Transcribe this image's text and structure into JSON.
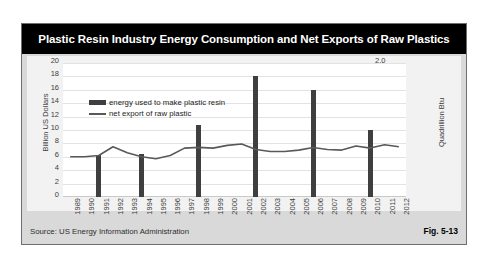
{
  "figure": {
    "title": "Plastic Resin Industry Energy Consumption and Net Exports of Raw Plastics",
    "source": "Source:  US Energy Information Administration",
    "fig_label": "Fig. 5-13",
    "colors": {
      "title_bar_bg": "#000000",
      "title_text": "#ffffff",
      "frame_bg": "#d9d9d9",
      "chart_bg": "#f2f2f2",
      "plot_bg": "#ffffff",
      "bar": "#3f3f3f",
      "line": "#595959",
      "grid": "#e3e3e3"
    }
  },
  "chart_data": {
    "type": "bar",
    "title": "Plastic Resin Industry Energy Consumption and Net Exports of Raw Plastics",
    "xlabel": "",
    "ylabel": "Billion US Dollars",
    "y2label": "Quadrillion Btu",
    "ylim": [
      0,
      20
    ],
    "y2lim": [
      0.0,
      2.0
    ],
    "grid": true,
    "legend_position": "top-left",
    "categories": [
      "1989",
      "1990",
      "1991",
      "1992",
      "1993",
      "1994",
      "1995",
      "1996",
      "1997",
      "1998",
      "1999",
      "2000",
      "2001",
      "2002",
      "2003",
      "2004",
      "2005",
      "2006",
      "2007",
      "2008",
      "2009",
      "2010",
      "2011",
      "2012"
    ],
    "y_ticks": [
      0,
      2,
      4,
      6,
      8,
      10,
      12,
      14,
      16,
      18,
      20
    ],
    "y2_ticks": [
      "0.0",
      "0.2",
      "0.4",
      "0.6",
      "0.8",
      "1.0",
      "1.2",
      "1.4",
      "1.6",
      "1.8",
      "2.0"
    ],
    "series": [
      {
        "name": "energy used to make plastic resin",
        "type": "bar",
        "axis": "right",
        "unit": "Quadrillion Btu",
        "values": [
          null,
          null,
          0.63,
          null,
          null,
          0.64,
          null,
          null,
          null,
          1.07,
          null,
          null,
          null,
          1.8,
          null,
          null,
          null,
          1.6,
          null,
          null,
          null,
          1.0,
          null,
          null
        ]
      },
      {
        "name": "net export of raw plastic",
        "type": "line",
        "axis": "left",
        "unit": "Billion US Dollars",
        "values": [
          6.0,
          6.0,
          6.2,
          7.5,
          6.6,
          6.0,
          5.7,
          6.2,
          7.3,
          7.4,
          7.3,
          7.7,
          7.9,
          7.1,
          6.8,
          6.8,
          7.0,
          7.4,
          7.1,
          7.0,
          7.6,
          7.3,
          7.8,
          7.5
        ]
      }
    ]
  },
  "legend": {
    "items": [
      {
        "label": "energy used to make plastic resin",
        "marker": "bar"
      },
      {
        "label": "net export of raw plastic",
        "marker": "line"
      }
    ]
  }
}
